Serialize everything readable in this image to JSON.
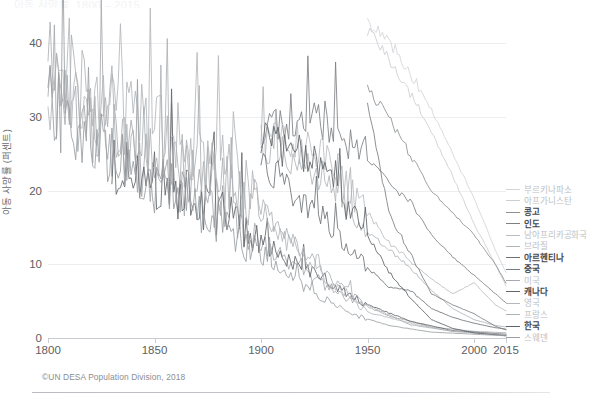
{
  "header": {
    "clipped_title": "아동 사망률, 1800 – 2015"
  },
  "source_note": "©UN DESA Population Division, 2018",
  "chart_data": {
    "type": "line",
    "title": "아동 사망률, 1800 – 2015",
    "xlabel": "",
    "ylabel": "아동 사망률 (퍼센트)",
    "xlim": [
      1800,
      2015
    ],
    "ylim": [
      0,
      44
    ],
    "xticks": [
      1800,
      1850,
      1900,
      1950,
      2000,
      2015
    ],
    "xticklabels": [
      "1800",
      "1850",
      "1900",
      "1950",
      "2000",
      "2015"
    ],
    "yticks": [
      0,
      10,
      20,
      30,
      40
    ],
    "yticklabels": [
      "0",
      "10",
      "20",
      "30",
      "40"
    ],
    "grid": "horizontal",
    "legend_position": "right-outside",
    "series": [
      {
        "name": "부르키나파소",
        "color": "#d3d5d8",
        "x": [
          1950,
          1960,
          1970,
          1980,
          1990,
          2000,
          2010,
          2015
        ],
        "values": [
          43.0,
          40.5,
          36.0,
          31.0,
          25.0,
          19.0,
          12.0,
          8.9
        ]
      },
      {
        "name": "아프가니스탄",
        "color": "#cbced1",
        "x": [
          1950,
          1960,
          1970,
          1980,
          1990,
          2000,
          2010,
          2015
        ],
        "values": [
          41.5,
          38.0,
          33.0,
          28.0,
          22.0,
          15.5,
          10.0,
          7.1
        ]
      },
      {
        "name": "콩고",
        "color": "#8d9195",
        "x": [
          1950,
          1960,
          1970,
          1980,
          1990,
          2000,
          2010,
          2015
        ],
        "values": [
          33.5,
          30.0,
          25.0,
          20.0,
          17.0,
          14.0,
          10.0,
          7.5
        ]
      },
      {
        "name": "인도",
        "color": "#7c8084",
        "x": [
          1900,
          1920,
          1940,
          1950,
          1960,
          1970,
          1980,
          1990,
          2000,
          2010,
          2015
        ],
        "values": [
          28.0,
          31.0,
          27.0,
          24.5,
          21.0,
          18.5,
          14.0,
          11.0,
          8.5,
          6.0,
          4.8
        ]
      },
      {
        "name": "남아프리카공화국",
        "color": "#b9bcc0",
        "x": [
          1900,
          1925,
          1950,
          1960,
          1970,
          1980,
          1990,
          2000,
          2010,
          2015
        ],
        "values": [
          27.5,
          26.0,
          17.0,
          13.0,
          10.5,
          8.0,
          6.0,
          7.5,
          4.5,
          3.7
        ]
      },
      {
        "name": "브라질",
        "color": "#b0b3b7",
        "x": [
          1900,
          1930,
          1950,
          1960,
          1970,
          1980,
          1990,
          2000,
          2010,
          2015
        ],
        "values": [
          26.0,
          22.0,
          14.5,
          12.0,
          9.5,
          6.5,
          4.0,
          2.5,
          1.7,
          1.5
        ]
      },
      {
        "name": "아르헨티나",
        "color": "#6e7276",
        "x": [
          1900,
          1930,
          1950,
          1960,
          1970,
          1980,
          1990,
          2000,
          2010,
          2015
        ],
        "values": [
          24.0,
          16.0,
          9.5,
          7.0,
          6.5,
          4.0,
          2.8,
          2.0,
          1.4,
          1.2
        ]
      },
      {
        "name": "중국",
        "color": "#7a7e82",
        "x": [
          1950,
          1960,
          1970,
          1980,
          1990,
          2000,
          2010,
          2015
        ],
        "values": [
          31.5,
          17.0,
          11.5,
          6.0,
          4.5,
          3.3,
          1.6,
          1.1
        ]
      },
      {
        "name": "미국",
        "color": "#a6a9ad",
        "x": [
          1800,
          1850,
          1880,
          1900,
          1920,
          1940,
          1960,
          1980,
          2000,
          2015
        ],
        "values": [
          33.0,
          22.5,
          18.0,
          13.0,
          9.0,
          5.5,
          3.0,
          1.5,
          0.9,
          0.7
        ]
      },
      {
        "name": "캐나다",
        "color": "#62666a",
        "x": [
          1830,
          1860,
          1890,
          1910,
          1930,
          1950,
          1970,
          1990,
          2015
        ],
        "values": [
          24.0,
          20.0,
          15.5,
          11.0,
          8.0,
          4.5,
          2.3,
          1.0,
          0.5
        ]
      },
      {
        "name": "영국",
        "color": "#b4b7bb",
        "x": [
          1800,
          1830,
          1860,
          1890,
          1910,
          1930,
          1950,
          1970,
          1990,
          2015
        ],
        "values": [
          33.0,
          30.0,
          27.5,
          22.5,
          13.5,
          8.0,
          3.5,
          2.0,
          0.9,
          0.4
        ]
      },
      {
        "name": "프랑스",
        "color": "#aeb1b5",
        "x": [
          1800,
          1830,
          1860,
          1890,
          1910,
          1930,
          1950,
          1970,
          1990,
          2015
        ],
        "values": [
          38.0,
          28.0,
          25.5,
          20.0,
          15.0,
          8.5,
          4.5,
          1.8,
          0.9,
          0.4
        ]
      },
      {
        "name": "한국",
        "color": "#5e6266",
        "x": [
          1900,
          1925,
          1950,
          1960,
          1970,
          1980,
          1990,
          2000,
          2015
        ],
        "values": [
          27.0,
          24.0,
          14.0,
          9.0,
          5.5,
          2.5,
          1.3,
          0.7,
          0.3
        ]
      },
      {
        "name": "스웨덴",
        "color": "#9a9ea2",
        "x": [
          1800,
          1820,
          1840,
          1860,
          1880,
          1900,
          1920,
          1940,
          1960,
          1980,
          2015
        ],
        "values": [
          33.0,
          27.0,
          22.0,
          20.0,
          16.0,
          11.0,
          7.0,
          3.5,
          1.7,
          0.8,
          0.3
        ]
      }
    ],
    "legend_entries": [
      {
        "label": "부르키나파소",
        "color": "#d3d5d8",
        "emphasis": false
      },
      {
        "label": "아프가니스탄",
        "color": "#cbced1",
        "emphasis": false
      },
      {
        "label": "콩고",
        "color": "#8d9195",
        "emphasis": true
      },
      {
        "label": "인도",
        "color": "#7c8084",
        "emphasis": true
      },
      {
        "label": "남아프리카공화국",
        "color": "#b9bcc0",
        "emphasis": false
      },
      {
        "label": "브라질",
        "color": "#b0b3b7",
        "emphasis": false
      },
      {
        "label": "아르헨티나",
        "color": "#6e7276",
        "emphasis": true
      },
      {
        "label": "중국",
        "color": "#7a7e82",
        "emphasis": true
      },
      {
        "label": "미국",
        "color": "#a6a9ad",
        "emphasis": false
      },
      {
        "label": "캐나다",
        "color": "#62666a",
        "emphasis": true
      },
      {
        "label": "영국",
        "color": "#b4b7bb",
        "emphasis": false
      },
      {
        "label": "프랑스",
        "color": "#aeb1b5",
        "emphasis": false
      },
      {
        "label": "한국",
        "color": "#5e6266",
        "emphasis": true
      },
      {
        "label": "스웨덴",
        "color": "#9a9ea2",
        "emphasis": false
      }
    ]
  }
}
